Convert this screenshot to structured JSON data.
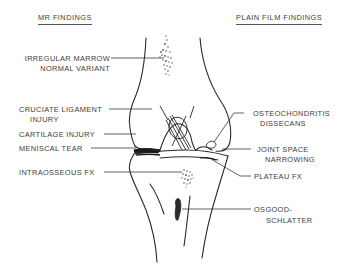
{
  "headings": {
    "left": "MR FINDINGS",
    "right": "PLAIN FILM FINDINGS"
  },
  "left_labels": [
    {
      "line1": "IRREGULAR MARROW",
      "line2": "NORMAL VARIANT"
    },
    {
      "line1": "CRUCIATE LIGAMENT",
      "line2": "INJURY"
    },
    {
      "line1": "CARTILAGE INJURY",
      "line2": ""
    },
    {
      "line1": "MENISCAL TEAR",
      "line2": ""
    },
    {
      "line1": "INTRAOSSEOUS FX",
      "line2": ""
    }
  ],
  "right_labels": [
    {
      "line1": "OSTEOCHONDRITIS",
      "line2": "DISSECANS"
    },
    {
      "line1": "JOINT SPACE",
      "line2": "NARROWING"
    },
    {
      "line1": "PLATEAU FX",
      "line2": ""
    },
    {
      "line1": "OSGOOD-",
      "line2": "SCHLATTER"
    }
  ],
  "figure": {
    "line_color": "#2a2a2a"
  }
}
